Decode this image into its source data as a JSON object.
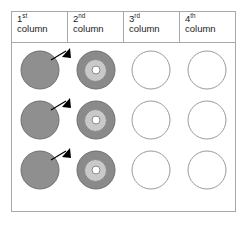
{
  "figure": {
    "columns": [
      {
        "ordinal_number": "1",
        "ordinal_suffix": "st",
        "word": "column",
        "content": "solid-gray-disc"
      },
      {
        "ordinal_number": "2",
        "ordinal_suffix": "nd",
        "word": "column",
        "content": "concentric-target-disc"
      },
      {
        "ordinal_number": "3",
        "ordinal_suffix": "rd",
        "word": "column",
        "content": "empty-circle"
      },
      {
        "ordinal_number": "4",
        "ordinal_suffix": "th",
        "word": "column",
        "content": "empty-circle"
      }
    ],
    "row_count": 3,
    "arrow": {
      "direction": "up-right",
      "from_column": "1st column",
      "to_column": "2nd column",
      "repeated_per_row": true
    },
    "colors": {
      "border": "#a8a8a8",
      "solid_disc_fill": "#8f8f8f",
      "solid_disc_stroke": "#6e6e6e",
      "target_outer_fill": "#8a8a8a",
      "target_middle_fill": "#c9c9c9",
      "target_core_fill": "#ffffff",
      "empty_circle_stroke": "#9a9a9a",
      "background": "#ffffff",
      "text": "#1c1c1c",
      "arrow": "#000000"
    }
  }
}
